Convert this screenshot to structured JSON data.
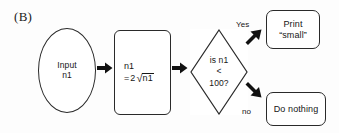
{
  "figure": {
    "panel_label": "(B)",
    "background_color": "#fdfdfd",
    "stroke_color": "#2a2a2a",
    "text_color": "#161616"
  },
  "flowchart": {
    "nodes": [
      {
        "id": "input",
        "shape": "ellipse",
        "role": "terminator-input",
        "text": "Input\nn1"
      },
      {
        "id": "process",
        "shape": "rounded-rectangle",
        "role": "process",
        "text": "n1 = 2√n1",
        "formula": {
          "line1": "n1",
          "equals": "=",
          "coefficient": "2",
          "radical_symbol": "√",
          "radicand": "n1"
        }
      },
      {
        "id": "decision",
        "shape": "diamond",
        "role": "decision",
        "text": "is n1\n<\n100?",
        "lines": [
          "is n1",
          "<",
          "100?"
        ]
      },
      {
        "id": "print_small",
        "shape": "rounded-rectangle",
        "role": "output",
        "text": "Print\n“small”"
      },
      {
        "id": "do_nothing",
        "shape": "rounded-rectangle",
        "role": "output",
        "text": "Do nothing"
      }
    ],
    "edges": [
      {
        "id": "input-to-process",
        "from": "input",
        "to": "process",
        "label": "",
        "icon": "right-arrow-icon"
      },
      {
        "id": "process-to-decision",
        "from": "process",
        "to": "decision",
        "label": "",
        "icon": "right-arrow-icon"
      },
      {
        "id": "decision-to-print",
        "from": "decision",
        "to": "print_small",
        "label": "Yes",
        "icon": "up-right-arrow-icon"
      },
      {
        "id": "decision-to-donothing",
        "from": "decision",
        "to": "do_nothing",
        "label": "no",
        "icon": "down-right-arrow-icon"
      }
    ]
  }
}
